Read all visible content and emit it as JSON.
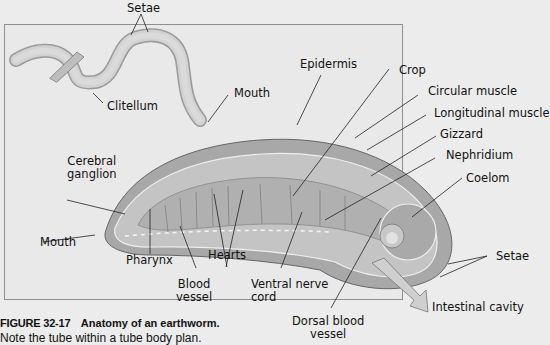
{
  "figure": {
    "number": "FIGURE 32-17",
    "title": "Anatomy of an earthworm.",
    "note": "Note the tube within a tube body plan."
  },
  "labels": {
    "setae_top": "Setae",
    "clitellum": "Clitellum",
    "mouth_worm": "Mouth",
    "epidermis": "Epidermis",
    "crop": "Crop",
    "circular_muscle": "Circular muscle",
    "longitudinal_muscle": "Longitudinal muscle",
    "gizzard": "Gizzard",
    "nephridium": "Nephridium",
    "coelom": "Coelom",
    "cerebral_ganglion_1": "Cerebral",
    "cerebral_ganglion_2": "ganglion",
    "mouth_section": "Mouth",
    "pharynx": "Pharynx",
    "hearts": "Hearts",
    "blood_vessel_1": "Blood",
    "blood_vessel_2": "vessel",
    "ventral_nerve_cord_1": "Ventral nerve",
    "ventral_nerve_cord_2": "cord",
    "setae_right": "Setae",
    "intestinal_cavity": "Intestinal cavity",
    "dorsal_blood_vessel_1": "Dorsal blood",
    "dorsal_blood_vessel_2": "vessel"
  },
  "colors": {
    "background": "#ececec",
    "panel": "#e9e9e9",
    "body_tissue": "#b5b5b5",
    "body_dark": "#8e8e8e",
    "leader_line": "#222222"
  }
}
